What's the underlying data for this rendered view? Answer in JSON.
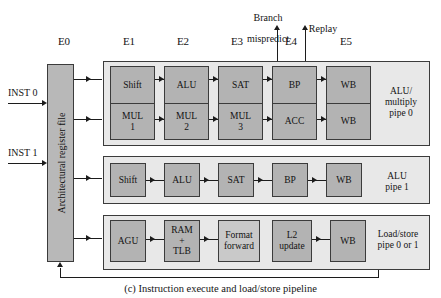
{
  "figure": {
    "caption": "(c) Instruction execute and load/store pipeline"
  },
  "stage_labels": [
    {
      "id": "E0",
      "label": "E0"
    },
    {
      "id": "E1",
      "label": "E1"
    },
    {
      "id": "E2",
      "label": "E2"
    },
    {
      "id": "E3",
      "label": "E3"
    },
    {
      "id": "E4",
      "label": "E4"
    },
    {
      "id": "E5",
      "label": "E5"
    }
  ],
  "top_annotations": [
    {
      "id": "branch-mispredict",
      "line1": "Branch",
      "line2": "mispredict"
    },
    {
      "id": "replay",
      "line1": "Replay",
      "line2": ""
    }
  ],
  "inputs": [
    {
      "id": "inst0",
      "label": "INST 0"
    },
    {
      "id": "inst1",
      "label": "INST 1"
    }
  ],
  "register_file": {
    "label": "Architectural register file"
  },
  "pipelines": [
    {
      "id": "alu-multiply-pipe-0",
      "caption_line1": "ALU/",
      "caption_line2": "multiply",
      "caption_line3": "pipe 0",
      "stages": [
        {
          "stage": "E1",
          "top": "Shift",
          "bottom_line1": "MUL",
          "bottom_line2": "1"
        },
        {
          "stage": "E2",
          "top": "ALU",
          "bottom_line1": "MUL",
          "bottom_line2": "2"
        },
        {
          "stage": "E3",
          "top": "SAT",
          "bottom_line1": "MUL",
          "bottom_line2": "3"
        },
        {
          "stage": "E4",
          "top": "BP",
          "bottom_line1": "ACC",
          "bottom_line2": ""
        },
        {
          "stage": "E5",
          "top": "WB",
          "bottom_line1": "WB",
          "bottom_line2": ""
        }
      ]
    },
    {
      "id": "alu-pipe-1",
      "caption_line1": "ALU",
      "caption_line2": "pipe 1",
      "caption_line3": "",
      "stages": [
        {
          "stage": "E1",
          "label": "Shift"
        },
        {
          "stage": "E2",
          "label": "ALU"
        },
        {
          "stage": "E3",
          "label": "SAT"
        },
        {
          "stage": "E4",
          "label": "BP"
        },
        {
          "stage": "E5",
          "label": "WB"
        }
      ]
    },
    {
      "id": "load-store-pipe",
      "caption_line1": "Load/store",
      "caption_line2": "pipe 0 or 1",
      "caption_line3": "",
      "stages": [
        {
          "stage": "E1",
          "line1": "AGU",
          "line2": "",
          "line3": ""
        },
        {
          "stage": "E2",
          "line1": "RAM",
          "line2": "+",
          "line3": "TLB"
        },
        {
          "stage": "E3",
          "line1": "Format",
          "line2": "forward",
          "line3": ""
        },
        {
          "stage": "E4",
          "line1": "L2",
          "line2": "update",
          "line3": ""
        },
        {
          "stage": "E5",
          "line1": "WB",
          "line2": "",
          "line3": ""
        }
      ]
    }
  ],
  "colors": {
    "unit_fill": "#b3b3b3",
    "unit_fill_light": "#c9c9c9",
    "group_fill": "#e8e8e8",
    "regfile_fill": "#b8b8b8",
    "stroke": "#3b3b3b",
    "line": "#1c1c1c",
    "text": "#141414",
    "background": "#ffffff"
  }
}
